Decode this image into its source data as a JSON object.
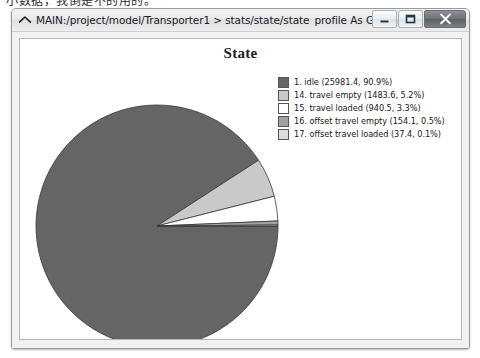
{
  "page": {
    "overlay_text": "小数据，我倒是不的用的。"
  },
  "window": {
    "title": "MAIN:/project/model/Transporter1 > stats/state/state_profile As Graph",
    "icon": "caret-up-icon",
    "buttons": {
      "minimize": "minimize-icon",
      "maximize": "maximize-icon",
      "close": "close-icon"
    }
  },
  "chart_data": {
    "type": "pie",
    "title": "State",
    "xlabel": "",
    "ylabel": "",
    "legend_position": "right",
    "grid": false,
    "start_angle_deg": 0,
    "direction": "clockwise",
    "categories": [
      "1. idle",
      "14. travel empty",
      "15. travel loaded",
      "16. offset travel empty",
      "17. offset travel loaded"
    ],
    "values": [
      25981.4,
      1483.6,
      940.5,
      154.1,
      37.4
    ],
    "percents": [
      90.9,
      5.2,
      3.3,
      0.5,
      0.1
    ],
    "colors": [
      "#656565",
      "#c9c9c9",
      "#ffffff",
      "#a2a2a2",
      "#dcdcdc"
    ],
    "legend": [
      {
        "label": "1. idle (25981.4, 90.9%)",
        "name": "1. idle",
        "value": 25981.4,
        "percent": 90.9,
        "color": "#656565"
      },
      {
        "label": "14. travel empty (1483.6, 5.2%)",
        "name": "14. travel empty",
        "value": 1483.6,
        "percent": 5.2,
        "color": "#c9c9c9"
      },
      {
        "label": "15. travel loaded (940.5, 3.3%)",
        "name": "15. travel loaded",
        "value": 940.5,
        "percent": 3.3,
        "color": "#ffffff"
      },
      {
        "label": "16. offset travel empty (154.1, 0.5%)",
        "name": "16. offset travel empty",
        "value": 154.1,
        "percent": 0.5,
        "color": "#a2a2a2"
      },
      {
        "label": "17. offset travel loaded (37.4, 0.1%)",
        "name": "17. offset travel loaded",
        "value": 37.4,
        "percent": 0.1,
        "color": "#dcdcdc"
      }
    ]
  }
}
